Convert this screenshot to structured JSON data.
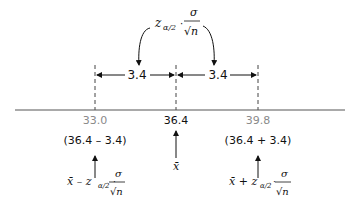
{
  "diagram": {
    "top_formula": {
      "z": "z",
      "sub": "α/2",
      "dot": "·",
      "num": "σ",
      "den": "√n"
    },
    "interval_widths": [
      "3.4",
      "3.4"
    ],
    "axis_ticks": [
      {
        "label": "33.0",
        "x": 95
      },
      {
        "label": "36.4",
        "x": 176
      },
      {
        "label": "39.8",
        "x": 258
      }
    ],
    "lower": {
      "expr": "(36.4 – 3.4)",
      "formula_prefix": "x̄ – z",
      "sub": "α/2",
      "num": "σ",
      "den": "√n"
    },
    "center": {
      "label": "x̄"
    },
    "upper": {
      "expr": "(36.4 + 3.4)",
      "formula_prefix": "x̄ + z",
      "sub": "α/2",
      "num": "σ",
      "den": "√n"
    }
  }
}
